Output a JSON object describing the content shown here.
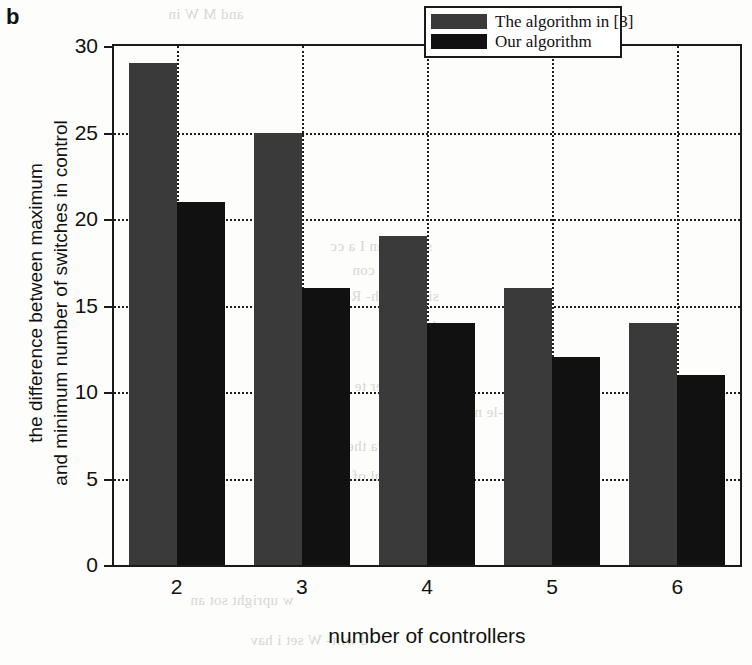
{
  "panel_label": "b",
  "chart_data": {
    "type": "bar",
    "title": "",
    "subtitle": "",
    "categories": [
      "2",
      "3",
      "4",
      "5",
      "6"
    ],
    "series": [
      {
        "name": "The algorithm in [3]",
        "values": [
          29,
          25,
          19,
          16,
          14
        ],
        "color": "#3a3a3a"
      },
      {
        "name": "Our algorithm",
        "values": [
          21,
          16,
          14,
          12,
          11
        ],
        "color": "#111111"
      }
    ],
    "xlabel": "number of controllers",
    "ylabel_lines": [
      "the difference between maximum",
      "and minimum number of switches in control"
    ],
    "ylabel": "the difference between maximum and minimum number of switches in control",
    "ylim": [
      0,
      30
    ],
    "yticks": [
      0,
      5,
      10,
      15,
      20,
      25,
      30
    ],
    "ytick_labels": [
      "0",
      "5",
      "10",
      "15",
      "20",
      "25",
      "30"
    ],
    "grid": "dotted-both",
    "legend_position": "top-right"
  },
  "background_text": [
    "and  M   W   in",
    "sen)  Than  I  a  cc",
    "a    gan        te  con",
    "si  wit    with-  Ren",
    "1",
    "sensew  Ther        te  soca",
    "si-le                    m",
    "sng  Pa        the  Pub",
    "the  er            the  mul  of  Pees  an",
    "w  upright        sot      an",
    "d    wilt-  W    set  i  hav"
  ]
}
